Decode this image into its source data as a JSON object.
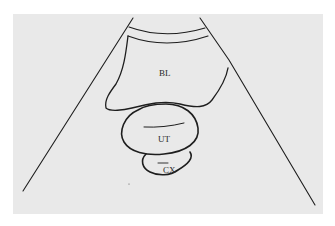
{
  "figure": {
    "title": "",
    "background_color": "#e9e9e9",
    "line_color": "#1e1e1e",
    "labels": {
      "bladder": "BL",
      "uterus": "UT",
      "cervix": "CX"
    }
  }
}
